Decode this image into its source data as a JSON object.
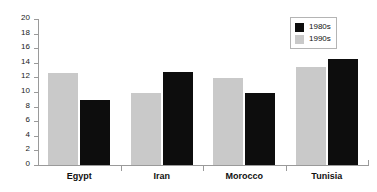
{
  "chart_data": {
    "type": "bar",
    "title": "",
    "subtitle": "",
    "xlabel": "",
    "ylabel": "",
    "categories": [
      "Egypt",
      "Iran",
      "Morocco",
      "Tunisia"
    ],
    "series": [
      {
        "name": "1980s",
        "color": "#0d0d0d",
        "values": [
          8.9,
          12.7,
          9.9,
          14.5
        ]
      },
      {
        "name": "1990s",
        "color": "#c9c9c9",
        "values": [
          12.6,
          9.9,
          11.9,
          13.4
        ]
      }
    ],
    "series_draw_order": [
      "1990s",
      "1980s"
    ],
    "ylim": [
      0,
      20
    ],
    "ytick_step": 2,
    "ytick_labels": [
      "0",
      "2",
      "4",
      "6",
      "8",
      "10",
      "12",
      "14",
      "16",
      "18",
      "20"
    ],
    "grid": false,
    "legend_position": "top-right",
    "legend_entries": [
      {
        "label": "1980s",
        "color": "#0d0d0d"
      },
      {
        "label": "1990s",
        "color": "#c9c9c9"
      }
    ],
    "axis_color": "#9a9a9a"
  }
}
